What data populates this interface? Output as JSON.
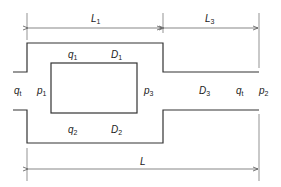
{
  "diagram": {
    "type": "pipe network schematic (parallel loop with downstream pipe)",
    "labels": {
      "L1": {
        "main": "L",
        "sub": "1"
      },
      "L3": {
        "main": "L",
        "sub": "3"
      },
      "L": {
        "main": "L",
        "sub": ""
      },
      "q1": {
        "main": "q",
        "sub": "1"
      },
      "D1": {
        "main": "D",
        "sub": "1"
      },
      "q2": {
        "main": "q",
        "sub": "2"
      },
      "D2": {
        "main": "D",
        "sub": "2"
      },
      "qt_in": {
        "main": "q",
        "sub": "t"
      },
      "p1": {
        "main": "p",
        "sub": "1"
      },
      "p3": {
        "main": "p",
        "sub": "3"
      },
      "D3": {
        "main": "D",
        "sub": "3"
      },
      "qt_out": {
        "main": "q",
        "sub": "t"
      },
      "p2": {
        "main": "p",
        "sub": "2"
      }
    },
    "colors": {
      "line": "#333333",
      "text": "#222222",
      "background": "#ffffff"
    }
  }
}
